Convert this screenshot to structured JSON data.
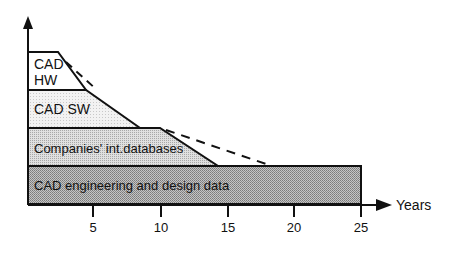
{
  "figure": {
    "type": "layered-area-diagram",
    "x_axis": {
      "label": "Years",
      "ticks": [
        "5",
        "10",
        "15",
        "20",
        "25"
      ]
    },
    "layers": [
      {
        "id": "cad-hw",
        "label_line1": "CAD",
        "label_line2": "HW",
        "fill": "#ffffff",
        "span_years": [
          0,
          5
        ]
      },
      {
        "id": "cad-sw",
        "label": "CAD SW",
        "fill": "#f0f0f0",
        "span_years": [
          0,
          10
        ]
      },
      {
        "id": "databases",
        "label": "Companies' int.databases",
        "fill": "#d8d8d8",
        "span_years": [
          0,
          15
        ]
      },
      {
        "id": "cad-eng",
        "label": "CAD engineering and design data",
        "fill": "#b4b4b4",
        "span_years": [
          0,
          25
        ]
      }
    ],
    "dashed_extensions": [
      {
        "from_layer": "cad-hw",
        "extended_end_year": 5.5
      },
      {
        "from_layer": "databases",
        "extended_end_year": 20
      }
    ]
  }
}
